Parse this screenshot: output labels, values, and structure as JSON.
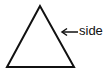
{
  "diagram": {
    "shape": "triangle",
    "stroke_color": "#111111",
    "fill_color": "#ffffff",
    "annotation": {
      "label": "side",
      "arrow_direction": "left",
      "target": "right-side-of-triangle"
    }
  }
}
